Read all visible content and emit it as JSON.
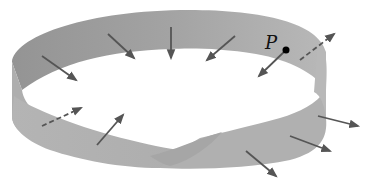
{
  "figure": {
    "point_label": "P",
    "colors": {
      "background": "#ffffff",
      "strip_dark": "#9a9a9a",
      "strip_mid": "#aaaaaa",
      "strip_light": "#b6b6b6",
      "arrow": "#555555",
      "point": "#000000"
    },
    "arrows": [
      {
        "id": "a1",
        "x1": 42,
        "y1": 56,
        "x2": 76,
        "y2": 80,
        "dashed": false
      },
      {
        "id": "a2",
        "x1": 108,
        "y1": 34,
        "x2": 134,
        "y2": 58,
        "dashed": false
      },
      {
        "id": "a3",
        "x1": 171,
        "y1": 27,
        "x2": 171,
        "y2": 58,
        "dashed": false
      },
      {
        "id": "a4",
        "x1": 235,
        "y1": 36,
        "x2": 207,
        "y2": 60,
        "dashed": false
      },
      {
        "id": "a5",
        "x1": 286,
        "y1": 50,
        "x2": 259,
        "y2": 76,
        "dashed": false
      },
      {
        "id": "a6",
        "x1": 300,
        "y1": 60,
        "x2": 334,
        "y2": 34,
        "dashed": true
      },
      {
        "id": "a7",
        "x1": 42,
        "y1": 126,
        "x2": 81,
        "y2": 108,
        "dashed": true
      },
      {
        "id": "a8",
        "x1": 97,
        "y1": 145,
        "x2": 123,
        "y2": 115,
        "dashed": false
      },
      {
        "id": "a9",
        "x1": 318,
        "y1": 116,
        "x2": 358,
        "y2": 126,
        "dashed": false
      },
      {
        "id": "a10",
        "x1": 290,
        "y1": 136,
        "x2": 330,
        "y2": 151,
        "dashed": false
      },
      {
        "id": "a11",
        "x1": 246,
        "y1": 151,
        "x2": 276,
        "y2": 176,
        "dashed": false
      }
    ],
    "point": {
      "x": 286,
      "y": 50,
      "r": 3.5
    }
  }
}
